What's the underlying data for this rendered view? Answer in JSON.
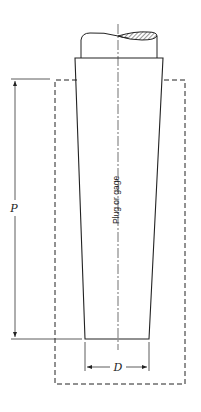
{
  "diagram": {
    "type": "technical-drawing",
    "labels": {
      "part": "Plug or gage",
      "length_dimension": "P",
      "diameter_dimension": "D"
    },
    "colors": {
      "line": "#222222",
      "hatch": "#444444",
      "background": "#ffffff"
    }
  }
}
